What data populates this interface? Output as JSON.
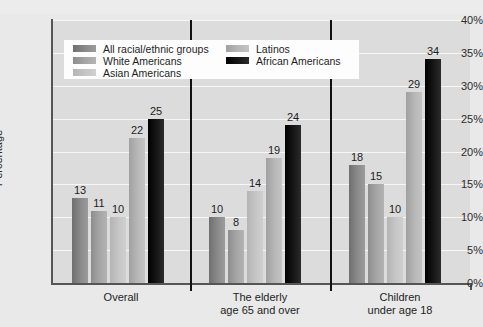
{
  "chart_data": {
    "type": "bar",
    "title": "",
    "xlabel": "",
    "ylabel": "Percentage",
    "ylim": [
      0,
      40
    ],
    "ytick_labels": [
      "0%",
      "5%",
      "10%",
      "15%",
      "20%",
      "25%",
      "30%",
      "35%",
      "40%"
    ],
    "ytick_values": [
      0,
      5,
      10,
      15,
      20,
      25,
      30,
      35,
      40
    ],
    "grid": "horizontal",
    "legend_position": "top-left-inside",
    "categories": [
      "Overall",
      "The elderly\nage 65 and over",
      "Children\nunder age 18"
    ],
    "series": [
      {
        "name": "All racial/ethnic groups",
        "color": "#8b8b8b",
        "values": [
          13,
          10,
          18
        ]
      },
      {
        "name": "White Americans",
        "color": "#a6a6a6",
        "values": [
          11,
          8,
          15
        ]
      },
      {
        "name": "Asian Americans",
        "color": "#c6c6c6",
        "values": [
          10,
          null,
          10
        ]
      },
      {
        "name": "Latinos",
        "color": "#b8b8b8",
        "values": [
          22,
          19,
          29
        ]
      },
      {
        "name": "African Americans",
        "color": "#111111",
        "values": [
          25,
          24,
          34
        ]
      }
    ],
    "bar_labels": {
      "Overall": [
        "13",
        "11",
        "10",
        "22",
        "25"
      ],
      "The elderly age 65 and over": [
        "10",
        "8",
        "14",
        "19",
        "24"
      ],
      "Children under age 18": [
        "18",
        "15",
        "10",
        "29",
        "34"
      ]
    },
    "values_by_group": [
      [
        13,
        11,
        10,
        22,
        25
      ],
      [
        10,
        8,
        14,
        19,
        24
      ],
      [
        18,
        15,
        10,
        29,
        34
      ]
    ]
  },
  "legend": {
    "left_column": [
      {
        "label": "All racial/ethnic groups",
        "swatch": "s0"
      },
      {
        "label": "White Americans",
        "swatch": "s1"
      },
      {
        "label": "Asian Americans",
        "swatch": "s2"
      }
    ],
    "right_column": [
      {
        "label": "Latinos",
        "swatch": "s3"
      },
      {
        "label": "African Americans",
        "swatch": "s4"
      }
    ]
  },
  "colors": {
    "plot_background": "#dcdcdc",
    "figure_background": "#e9e9e9",
    "gridline": "#f7f7f7",
    "axis": "#555555",
    "legend_background": "#fdfdfd",
    "text": "#1d1d1d"
  }
}
